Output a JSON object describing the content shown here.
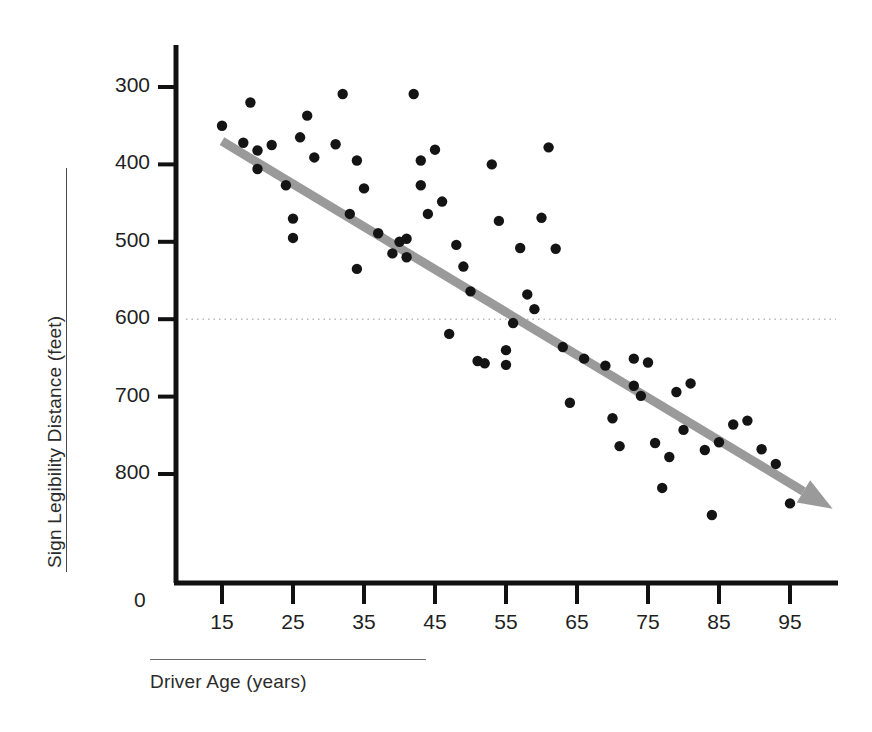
{
  "chart_data": {
    "type": "scatter",
    "title": "",
    "xlabel": "Driver Age (years)",
    "ylabel": "Sign Legibility Distance (feet)",
    "xlim": [
      8,
      101
    ],
    "ylim": [
      160,
      830
    ],
    "xticks": [
      15,
      25,
      35,
      45,
      55,
      65,
      75,
      85,
      95
    ],
    "yticks": [
      300,
      400,
      500,
      600,
      700,
      800
    ],
    "y_origin_label": "0",
    "grid": false,
    "legend": null,
    "reference_line": {
      "axis": "y",
      "value": 500,
      "style": "dotted",
      "color": "#b9b9b9"
    },
    "trendline": {
      "label": "negative linear trend",
      "style": "solid-arrow",
      "color": "#9a9a9a",
      "x_start": 15,
      "y_start": 730,
      "x_end": 101,
      "y_end": 255
    },
    "point_color": "#141414",
    "series": [
      {
        "name": "Drivers",
        "points": [
          [
            15,
            750
          ],
          [
            18,
            728
          ],
          [
            19,
            780
          ],
          [
            20,
            718
          ],
          [
            20,
            694
          ],
          [
            22,
            725
          ],
          [
            24,
            673
          ],
          [
            25,
            630
          ],
          [
            25,
            605
          ],
          [
            26,
            735
          ],
          [
            27,
            763
          ],
          [
            28,
            709
          ],
          [
            31,
            726
          ],
          [
            32,
            791
          ],
          [
            33,
            636
          ],
          [
            34,
            705
          ],
          [
            34,
            565
          ],
          [
            35,
            669
          ],
          [
            37,
            611
          ],
          [
            39,
            585
          ],
          [
            40,
            600
          ],
          [
            41,
            580
          ],
          [
            41,
            604
          ],
          [
            42,
            791
          ],
          [
            43,
            673
          ],
          [
            43,
            705
          ],
          [
            44,
            636
          ],
          [
            45,
            719
          ],
          [
            46,
            652
          ],
          [
            47,
            481
          ],
          [
            48,
            596
          ],
          [
            49,
            568
          ],
          [
            50,
            536
          ],
          [
            51,
            446
          ],
          [
            52,
            443
          ],
          [
            53,
            700
          ],
          [
            54,
            627
          ],
          [
            55,
            460
          ],
          [
            55,
            441
          ],
          [
            56,
            495
          ],
          [
            57,
            592
          ],
          [
            58,
            532
          ],
          [
            59,
            513
          ],
          [
            60,
            631
          ],
          [
            61,
            722
          ],
          [
            62,
            591
          ],
          [
            63,
            464
          ],
          [
            64,
            392
          ],
          [
            66,
            449
          ],
          [
            69,
            440
          ],
          [
            70,
            372
          ],
          [
            71,
            336
          ],
          [
            73,
            414
          ],
          [
            73,
            449
          ],
          [
            74,
            401
          ],
          [
            75,
            444
          ],
          [
            76,
            340
          ],
          [
            77,
            282
          ],
          [
            78,
            322
          ],
          [
            79,
            406
          ],
          [
            80,
            357
          ],
          [
            81,
            417
          ],
          [
            83,
            331
          ],
          [
            84,
            247
          ],
          [
            85,
            341
          ],
          [
            87,
            364
          ],
          [
            89,
            369
          ],
          [
            91,
            332
          ],
          [
            93,
            313
          ],
          [
            95,
            262
          ]
        ]
      }
    ]
  },
  "axis": {
    "y_zero": "0",
    "x_tick_labels": [
      "15",
      "25",
      "35",
      "45",
      "55",
      "65",
      "75",
      "85",
      "95"
    ],
    "y_tick_labels": [
      "800",
      "700",
      "600",
      "500",
      "400",
      "300"
    ]
  }
}
